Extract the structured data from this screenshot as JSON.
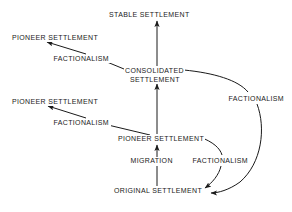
{
  "diagram": {
    "stroke_color": "#1a1a1a",
    "background_color": "#ffffff",
    "nodes": [
      {
        "id": "stable",
        "label": "STABLE SETTLEMENT",
        "x": 108,
        "y": 11
      },
      {
        "id": "pioneer_upper_left",
        "label": "PIONEER SETTLEMENT",
        "x": 11,
        "y": 34
      },
      {
        "id": "consolidated_line1",
        "label": "CONSOLIDATED",
        "x": 124,
        "y": 67
      },
      {
        "id": "consolidated_line2",
        "label": "SETTLEMENT",
        "x": 129,
        "y": 76
      },
      {
        "id": "pioneer_lower_left",
        "label": "PIONEER SETTLEMENT",
        "x": 11,
        "y": 98
      },
      {
        "id": "pioneer_center",
        "label": "PIONEER SETTLEMENT",
        "x": 117,
        "y": 135
      },
      {
        "id": "original",
        "label": "ORIGINAL SETTLEMENT",
        "x": 113,
        "y": 187
      }
    ],
    "edge_labels": [
      {
        "id": "factionalism_upper_left",
        "label": "FACTIONALISM",
        "x": 52,
        "y": 55
      },
      {
        "id": "factionalism_lower_left",
        "label": "FACTIONALISM",
        "x": 52,
        "y": 119
      },
      {
        "id": "migration",
        "label": "MIGRATION",
        "x": 129,
        "y": 157
      },
      {
        "id": "factionalism_right_lower",
        "label": "FACTIONALISM",
        "x": 191,
        "y": 157
      },
      {
        "id": "factionalism_right_upper",
        "label": "FACTIONALISM",
        "x": 227,
        "y": 95
      }
    ],
    "edges": [
      {
        "id": "original-to-pioneer-center",
        "from": "ORIGINAL SETTLEMENT",
        "to": "PIONEER SETTLEMENT",
        "via": "MIGRATION",
        "style": "straight-vertical"
      },
      {
        "id": "pioneer-center-to-consolidated",
        "from": "PIONEER SETTLEMENT",
        "to": "CONSOLIDATED SETTLEMENT",
        "via": "",
        "style": "straight-vertical"
      },
      {
        "id": "consolidated-to-stable",
        "from": "CONSOLIDATED SETTLEMENT",
        "to": "STABLE SETTLEMENT",
        "via": "",
        "style": "straight-vertical"
      },
      {
        "id": "consolidated-to-pioneer-upper-left",
        "from": "CONSOLIDATED SETTLEMENT",
        "to": "PIONEER SETTLEMENT",
        "via": "FACTIONALISM",
        "style": "straight-diagonal"
      },
      {
        "id": "pioneer-center-to-pioneer-lower-left",
        "from": "PIONEER SETTLEMENT",
        "to": "PIONEER SETTLEMENT",
        "via": "FACTIONALISM",
        "style": "straight-diagonal"
      },
      {
        "id": "pioneer-center-to-original",
        "from": "PIONEER SETTLEMENT",
        "to": "ORIGINAL SETTLEMENT",
        "via": "FACTIONALISM",
        "style": "curved-feedback"
      },
      {
        "id": "consolidated-to-original",
        "from": "CONSOLIDATED SETTLEMENT",
        "to": "ORIGINAL SETTLEMENT",
        "via": "FACTIONALISM",
        "style": "curved-feedback"
      }
    ]
  }
}
